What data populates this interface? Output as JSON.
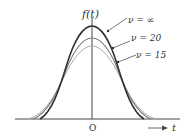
{
  "diagram": {
    "y_label": "f(t)",
    "x_label": "t",
    "origin_label": "O",
    "curves": [
      {
        "label": "ν = ∞",
        "color": "#333333",
        "width": 1.6
      },
      {
        "label": "ν = 20",
        "color": "#7a7a7a",
        "width": 1.1
      },
      {
        "label": "ν = 15",
        "color": "#a8a8a8",
        "width": 1.0
      }
    ]
  }
}
